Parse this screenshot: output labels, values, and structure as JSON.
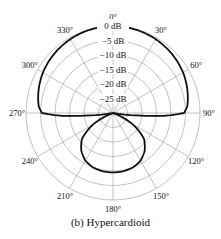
{
  "caption": "(b) Hypercardioid",
  "chart_data": {
    "type": "polar",
    "title": "(b) Hypercardioid",
    "angle_ticks": [
      0,
      30,
      60,
      90,
      120,
      150,
      180,
      210,
      240,
      270,
      300,
      330
    ],
    "angle_tick_labels": [
      "0°",
      "30°",
      "60°",
      "90°",
      "120°",
      "150°",
      "180°",
      "210°",
      "240°",
      "270°",
      "300°",
      "330°"
    ],
    "radial_ticks_db": [
      0,
      -5,
      -10,
      -15,
      -20,
      -25
    ],
    "radial_tick_labels": [
      "0 dB",
      "−5 dB",
      "−10 dB",
      "−15 dB",
      "−20 dB",
      "−25 dB"
    ],
    "r_range_db": [
      -30,
      0
    ],
    "grid": true,
    "series": [
      {
        "name": "Hypercardioid",
        "angles_deg": [
          0,
          10,
          20,
          30,
          40,
          50,
          60,
          70,
          80,
          85,
          90,
          93,
          96,
          100,
          110,
          120,
          130,
          140,
          150,
          160,
          170,
          180
        ],
        "values_db": [
          0,
          -0.1,
          -0.3,
          -0.6,
          -1.0,
          -1.5,
          -2.1,
          -2.9,
          -3.8,
          -4.3,
          -5.5,
          -12,
          -22,
          -30,
          -30,
          -22,
          -16,
          -13,
          -11,
          -10,
          -9.6,
          -9.5
        ]
      }
    ],
    "colors": {
      "curve": "#111111",
      "grid": "#9a9a9a",
      "text": "#111111"
    }
  }
}
